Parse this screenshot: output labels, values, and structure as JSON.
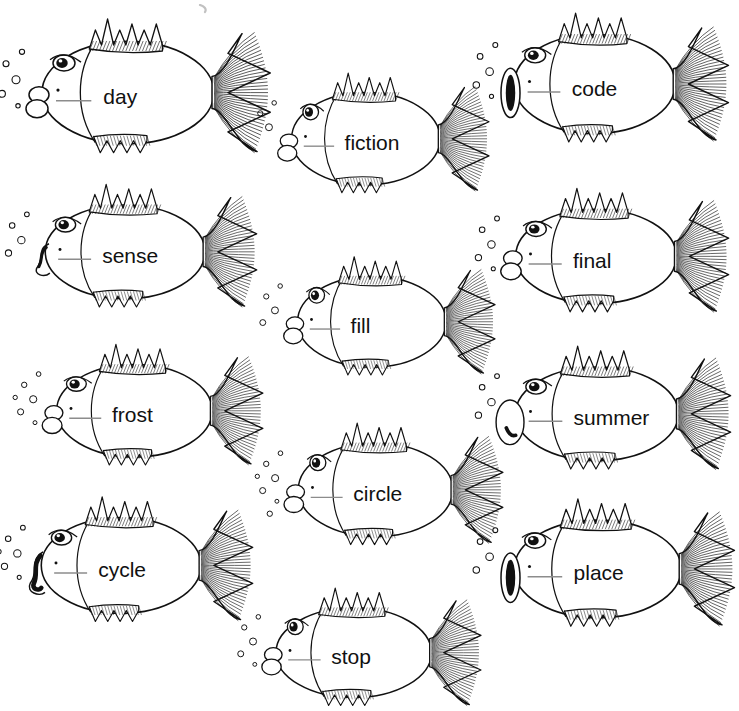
{
  "worksheet": {
    "background_color": "#ffffff",
    "ink_color": "#111111",
    "blank_line_color": "#8c8c8c",
    "title": "",
    "fish_count": 11
  },
  "fish": [
    {
      "id": "fish-day",
      "word": "day",
      "x": 8,
      "y": 12,
      "w": 268,
      "h": 155,
      "scale": 1.0,
      "mouth": "lips",
      "eye": "oval",
      "bubbles": 6
    },
    {
      "id": "fish-fiction",
      "word": "fiction",
      "x": 262,
      "y": 66,
      "w": 232,
      "h": 140,
      "scale": 0.87,
      "mouth": "lips",
      "eye": "round",
      "bubbles": 3
    },
    {
      "id": "fish-code",
      "word": "code",
      "x": 482,
      "y": 6,
      "w": 252,
      "h": 150,
      "scale": 0.95,
      "mouth": "dark-oval",
      "eye": "oval",
      "bubbles": 5
    },
    {
      "id": "fish-sense",
      "word": "sense",
      "x": 14,
      "y": 178,
      "w": 248,
      "h": 142,
      "scale": 0.92,
      "mouth": "wavy",
      "eye": "oval",
      "bubbles": 4
    },
    {
      "id": "fish-final",
      "word": "final",
      "x": 484,
      "y": 182,
      "w": 250,
      "h": 143,
      "scale": 0.93,
      "mouth": "lips",
      "eye": "oval",
      "bubbles": 5
    },
    {
      "id": "fish-fill",
      "word": "fill",
      "x": 268,
      "y": 250,
      "w": 232,
      "h": 138,
      "scale": 0.87,
      "mouth": "lips",
      "eye": "round",
      "bubbles": 4
    },
    {
      "id": "fish-frost",
      "word": "frost",
      "x": 26,
      "y": 338,
      "w": 242,
      "h": 140,
      "scale": 0.9,
      "mouth": "lips",
      "eye": "oval",
      "bubbles": 6
    },
    {
      "id": "fish-summer",
      "word": "summer",
      "x": 484,
      "y": 340,
      "w": 252,
      "h": 142,
      "scale": 0.93,
      "mouth": "big-lips",
      "eye": "oval",
      "bubbles": 4
    },
    {
      "id": "fish-circle",
      "word": "circle",
      "x": 268,
      "y": 416,
      "w": 240,
      "h": 142,
      "scale": 0.89,
      "mouth": "lips",
      "eye": "round",
      "bubbles": 7
    },
    {
      "id": "fish-cycle",
      "word": "cycle",
      "x": 10,
      "y": 490,
      "w": 248,
      "h": 145,
      "scale": 0.92,
      "mouth": "dark-wave",
      "eye": "oval",
      "bubbles": 6
    },
    {
      "id": "fish-place",
      "word": "place",
      "x": 482,
      "y": 492,
      "w": 258,
      "h": 148,
      "scale": 0.95,
      "mouth": "dark-oval",
      "eye": "oval",
      "bubbles": 4
    },
    {
      "id": "fish-stop",
      "word": "stop",
      "x": 246,
      "y": 582,
      "w": 240,
      "h": 136,
      "scale": 0.88,
      "mouth": "lips",
      "eye": "round",
      "bubbles": 5
    }
  ],
  "blank_line": {
    "label": "answer-blank"
  }
}
